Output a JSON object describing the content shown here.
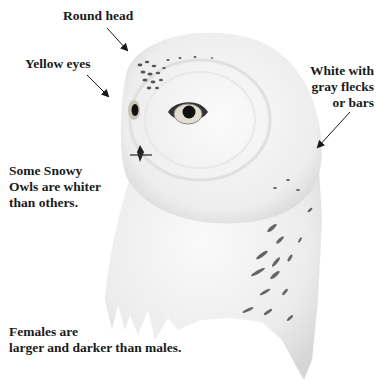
{
  "illustration": {
    "subject": "Snowy Owl head and upper body",
    "palette": {
      "background": "#ffffff",
      "feather_light": "#f4f4f4",
      "feather_shade": "#dcdcdc",
      "fleck": "#555555",
      "eye_ring": "#c9c4b5",
      "pupil": "#111111",
      "text": "#1a1a1a"
    }
  },
  "labels": {
    "round_head": "Round head",
    "yellow_eyes": "Yellow eyes",
    "white_gray": [
      "White with",
      "gray flecks",
      "or bars"
    ],
    "whiter": [
      "Some Snowy",
      "Owls are whiter",
      "than others."
    ],
    "females": [
      "Females are",
      "larger and darker than males."
    ]
  },
  "icons": {
    "arrow": "diagonal-arrow-icon"
  }
}
